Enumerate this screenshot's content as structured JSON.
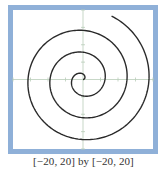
{
  "chart_data": {
    "type": "line",
    "title": "",
    "equation": "r = θ (polar), 0 ≤ θ ≤ 20",
    "xlabel": "",
    "ylabel": "",
    "xlim": [
      -20,
      20
    ],
    "ylim": [
      -20,
      20
    ],
    "xtick_step": 5,
    "ytick_step": 5,
    "grid": false,
    "axes_visible": true,
    "legend": null,
    "theta_range": [
      0,
      20
    ],
    "series": [
      {
        "name": "spiral",
        "color": "#2a2a2a",
        "polar": true,
        "r_equals_theta": true
      }
    ],
    "caption": "[−20, 20] by [−20, 20]"
  },
  "colors": {
    "frame": "#8fb0d8",
    "axis": "#b9cdb9",
    "curve": "#2a2a2a",
    "background": "#ffffff"
  }
}
